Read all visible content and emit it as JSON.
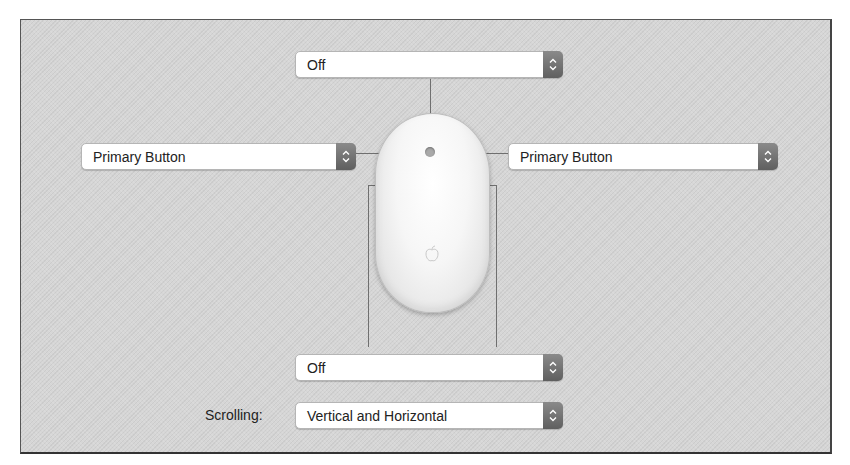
{
  "window": {
    "panel": "Mouse button and gesture configuration"
  },
  "controls": {
    "top_dropdown": {
      "value": "Off"
    },
    "left_dropdown": {
      "value": "Primary Button"
    },
    "right_dropdown": {
      "value": "Primary Button"
    },
    "bottom_dropdown": {
      "value": "Off"
    },
    "scrolling": {
      "label": "Scrolling:",
      "value": "Vertical and Horizontal"
    }
  },
  "icons": {
    "stepper": "up-down-chevron-icon",
    "mouse": "apple-mouse-illustration",
    "logo": "apple-logo-icon"
  },
  "colors": {
    "panel_bg": "#d6d6d6",
    "popup_bg": "#ffffff",
    "stepper_bg": "#6e6e6e",
    "leader_line": "#6f6f6f"
  }
}
